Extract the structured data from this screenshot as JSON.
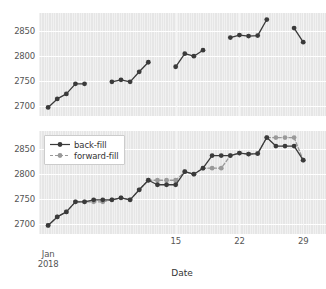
{
  "figure": {
    "width": 326,
    "height": 289,
    "background": "#ffffff",
    "plot_background": "#e6e6e6",
    "grid_color": "#ffffff"
  },
  "colors": {
    "backfill": "#3a3a3a",
    "forwardfill": "#999999",
    "text": "#555555",
    "title_text": "#333333"
  },
  "axis": {
    "xlabel": "Date",
    "ylabel": "",
    "yticks": [
      "2700",
      "2750",
      "2800",
      "2850"
    ],
    "ytick_values": [
      2700,
      2750,
      2800,
      2850
    ],
    "ylim": [
      2680,
      2885
    ],
    "xticks": [
      "15",
      "22",
      "29"
    ],
    "xtick_values": [
      15,
      22,
      29
    ],
    "xminor_label_line1": "Jan",
    "xminor_label_line2": "2018",
    "xminor_value": 1,
    "xlim": [
      0,
      31.5
    ],
    "grid": true
  },
  "legend": {
    "position": "upper-left",
    "entries": [
      {
        "label": "back-fill",
        "color": "#3a3a3a",
        "style": "solid"
      },
      {
        "label": "forward-fill",
        "color": "#999999",
        "style": "dashed"
      }
    ]
  },
  "chart_data": [
    {
      "type": "line",
      "panel": "top",
      "title": "",
      "xlabel": "",
      "ylabel": "",
      "grid": true,
      "ylim": [
        2680,
        2885
      ],
      "xlim": [
        0,
        31.5
      ],
      "legend": "none",
      "description": "Raw observed series with missing-value gaps",
      "series": [
        {
          "name": "observed",
          "color": "#3a3a3a",
          "style": "solid",
          "marker": "o",
          "segments": [
            {
              "x": [
                1,
                2,
                3,
                4,
                5
              ],
              "y": [
                2697,
                2714,
                2724,
                2744,
                2744
              ]
            },
            {
              "x": [
                8,
                9,
                10,
                11,
                12
              ],
              "y": [
                2748,
                2752,
                2748,
                2768,
                2787
              ]
            },
            {
              "x": [
                15,
                16,
                17,
                18
              ],
              "y": [
                2778,
                2804,
                2799,
                2811
              ]
            },
            {
              "x": [
                21,
                22,
                23,
                24,
                25
              ],
              "y": [
                2836,
                2841,
                2839,
                2840,
                2872
              ]
            },
            {
              "x": [
                28,
                29
              ],
              "y": [
                2855,
                2827
              ]
            }
          ]
        }
      ]
    },
    {
      "type": "line",
      "panel": "bottom",
      "title": "",
      "xlabel": "Date",
      "ylabel": "",
      "grid": true,
      "ylim": [
        2680,
        2885
      ],
      "xlim": [
        0,
        31.5
      ],
      "legend": "upper-left",
      "description": "Comparison of back-fill versus forward-fill imputation of the gaps",
      "x": [
        1,
        2,
        3,
        4,
        5,
        6,
        7,
        8,
        9,
        10,
        11,
        12,
        13,
        14,
        15,
        16,
        17,
        18,
        19,
        20,
        21,
        22,
        23,
        24,
        25,
        26,
        27,
        28,
        29
      ],
      "series": [
        {
          "name": "back-fill",
          "color": "#3a3a3a",
          "style": "solid",
          "marker": "o",
          "values": [
            2697,
            2714,
            2724,
            2744,
            2744,
            2748,
            2748,
            2748,
            2752,
            2748,
            2768,
            2787,
            2778,
            2778,
            2778,
            2804,
            2799,
            2811,
            2836,
            2836,
            2836,
            2841,
            2839,
            2840,
            2872,
            2855,
            2855,
            2855,
            2827
          ]
        },
        {
          "name": "forward-fill",
          "color": "#999999",
          "style": "dashed",
          "marker": "o",
          "values": [
            2697,
            2714,
            2724,
            2744,
            2744,
            2744,
            2744,
            2748,
            2752,
            2748,
            2768,
            2787,
            2787,
            2787,
            2787,
            2804,
            2799,
            2811,
            2811,
            2811,
            2836,
            2841,
            2839,
            2840,
            2872,
            2872,
            2872,
            2872,
            2827
          ]
        }
      ]
    }
  ]
}
